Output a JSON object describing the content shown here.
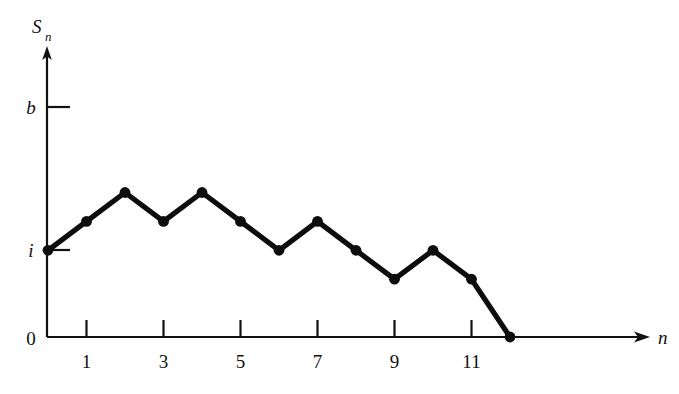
{
  "chart_data": {
    "type": "line",
    "title": "",
    "subtitle": "",
    "xlabel": "n",
    "ylabel": "S_n",
    "ylabel_base": "S",
    "ylabel_sub": "n",
    "grid": false,
    "legend": "none",
    "annotations": [],
    "series": [
      {
        "name": "S_n",
        "x": [
          0,
          1,
          2,
          3,
          4,
          5,
          6,
          7,
          8,
          9,
          10,
          11,
          12
        ],
        "values": [
          3,
          4,
          5,
          4,
          5,
          4,
          3,
          4,
          3,
          2,
          3,
          2,
          0
        ],
        "marker": "filled-circle",
        "color": "#0d0d0d"
      }
    ],
    "x": [
      0,
      1,
      2,
      3,
      4,
      5,
      6,
      7,
      8,
      9,
      10,
      11,
      12
    ],
    "values": [
      3,
      4,
      5,
      4,
      5,
      4,
      3,
      4,
      3,
      2,
      3,
      2,
      0
    ],
    "xlim": [
      0,
      15.6
    ],
    "ylim": [
      0,
      9.9
    ],
    "xticks": [
      1,
      3,
      5,
      7,
      9,
      11
    ],
    "xtick_labels": [
      "1",
      "3",
      "5",
      "7",
      "9",
      "11"
    ],
    "yticks": [
      0,
      3,
      8
    ],
    "ytick_labels": [
      "0",
      "i",
      "b"
    ],
    "ytick_label_italic": [
      false,
      true,
      true
    ],
    "y_levels": {
      "zero_label": "0",
      "i_label": "i",
      "i_value": 3,
      "b_label": "b",
      "b_value": 8
    },
    "colors": {
      "line": "#0d0d0d",
      "axis": "#111111",
      "background": "#ffffff",
      "text": "#111111"
    }
  },
  "axes": {
    "y_axis_name": "S",
    "y_axis_subscript": "n",
    "x_axis_name": "n"
  }
}
